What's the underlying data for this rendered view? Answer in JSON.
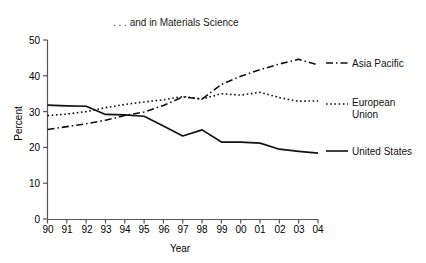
{
  "chart_data": {
    "type": "line",
    "title": ". . . and in Materials Science",
    "xlabel": "Year",
    "ylabel": "Percent",
    "categories": [
      "90",
      "91",
      "92",
      "93",
      "94",
      "95",
      "96",
      "97",
      "98",
      "99",
      "00",
      "01",
      "02",
      "03",
      "04"
    ],
    "x": [
      1990,
      1991,
      1992,
      1993,
      1994,
      1995,
      1996,
      1997,
      1998,
      1999,
      2000,
      2001,
      2002,
      2003,
      2004
    ],
    "ylim": [
      0,
      50
    ],
    "yticks": [
      "0",
      "10",
      "20",
      "30",
      "40",
      "50"
    ],
    "ytick_values": [
      0,
      10,
      20,
      30,
      40,
      50
    ],
    "grid": false,
    "legend_position": "right-inline",
    "series": [
      {
        "name": "Asia Pacific",
        "style": "dash-dot",
        "values": [
          25.0,
          25.8,
          26.6,
          27.6,
          28.9,
          29.9,
          31.7,
          34.1,
          33.5,
          37.6,
          39.9,
          41.7,
          43.3,
          44.6,
          43.0
        ]
      },
      {
        "name": "European Union",
        "style": "dotted",
        "values": [
          28.9,
          29.3,
          30.0,
          31.1,
          32.0,
          32.7,
          33.3,
          34.2,
          33.5,
          35.0,
          34.6,
          35.4,
          33.9,
          32.9,
          33.0
        ]
      },
      {
        "name": "United States",
        "style": "solid",
        "values": [
          31.8,
          31.6,
          31.5,
          29.2,
          29.1,
          28.7,
          26.0,
          23.2,
          24.9,
          21.5,
          21.5,
          21.2,
          19.5,
          18.9,
          18.4
        ]
      }
    ]
  },
  "legend": {
    "asia_pacific": "Asia Pacific",
    "european_union_line1": "European",
    "european_union_line2": "Union",
    "united_states": "United States"
  },
  "colors": {
    "line": "#111111",
    "axis": "#555555",
    "text": "#111111",
    "background": "#ffffff"
  }
}
